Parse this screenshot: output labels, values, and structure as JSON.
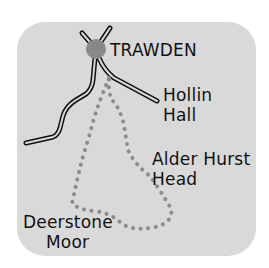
{
  "map": {
    "background_color": "#d9d9d9",
    "route_color": "#8c8c8c",
    "village_marker_color": "#888888",
    "labels": {
      "village": "TRAWDEN",
      "hollin_hall": [
        "Hollin",
        "Hall"
      ],
      "alder_hurst_head": [
        "Alder Hurst",
        "Head"
      ],
      "deerstone_moor": [
        "Deerstone",
        "Moor"
      ]
    },
    "icons": {
      "village": "filled-circle",
      "road": "double-line",
      "route": "dotted-line"
    }
  }
}
